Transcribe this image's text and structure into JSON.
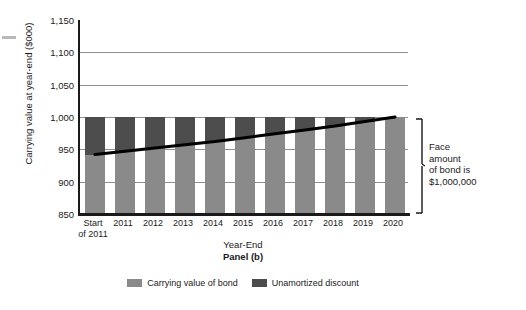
{
  "chart_data": {
    "type": "bar",
    "title": "Panel (b)",
    "xlabel": "Year-End",
    "ylabel": "Carrying value at year-end ($000)",
    "ylim": [
      850,
      1150
    ],
    "yticks": [
      "850",
      "900",
      "950",
      "1,000",
      "1,050",
      "1,100",
      "1,150"
    ],
    "ytick_values": [
      850,
      900,
      950,
      1000,
      1050,
      1100,
      1150
    ],
    "grid": true,
    "legend_position": "bottom",
    "categories": [
      "Start\nof 2011",
      "2011",
      "2012",
      "2013",
      "2014",
      "2015",
      "2016",
      "2017",
      "2018",
      "2019",
      "2020"
    ],
    "series": [
      {
        "name": "Carrying value of bond",
        "color": "#8a8a8a",
        "values": [
          942,
          947,
          952,
          957,
          962,
          968,
          974,
          980,
          986,
          993,
          1000
        ]
      },
      {
        "name": "Unamortized discount",
        "color": "#4d4d4d",
        "values": [
          58,
          53,
          48,
          43,
          38,
          32,
          26,
          20,
          14,
          7,
          0
        ]
      }
    ],
    "stacked_total": 1000,
    "trend_line": {
      "name": "Carrying value",
      "color": "#000000",
      "values": [
        942,
        947,
        952,
        957,
        962,
        968,
        974,
        980,
        986,
        993,
        1000
      ]
    },
    "annotations": [
      {
        "name": "face-amount-bracket",
        "text": "Face\namount\nof bond is\n$1,000,000",
        "from_value": 1000,
        "to_value": 850
      }
    ]
  },
  "legend": {
    "items": [
      {
        "label": "Carrying value of bond",
        "color": "#8a8a8a"
      },
      {
        "label": "Unamortized discount",
        "color": "#4d4d4d"
      }
    ]
  }
}
